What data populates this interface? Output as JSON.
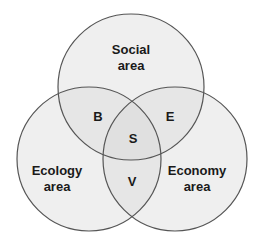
{
  "diagram": {
    "type": "venn-3",
    "circles": [
      {
        "id": "social",
        "label_line1": "Social",
        "label_line2": "area"
      },
      {
        "id": "ecology",
        "label_line1": "Ecology",
        "label_line2": "area"
      },
      {
        "id": "economy",
        "label_line1": "Economy",
        "label_line2": "area"
      }
    ],
    "intersections": {
      "social_ecology": "B",
      "social_economy": "E",
      "ecology_economy": "V",
      "all_three": "S"
    },
    "colors": {
      "fill": "#d8d8d8",
      "stroke": "#555555",
      "text": "#1a1a1a",
      "background": "#ffffff"
    }
  }
}
